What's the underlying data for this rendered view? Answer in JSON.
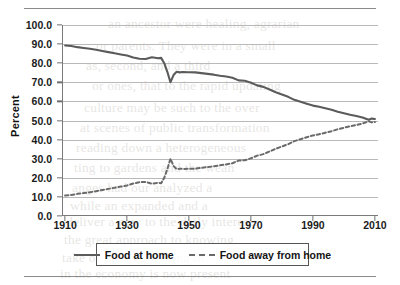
{
  "figure": {
    "rule_top": "",
    "rule_bottom": ""
  },
  "axis": {
    "y_title": "Percent"
  },
  "legend": {
    "items": [
      {
        "label": "Food at home",
        "style": "solid",
        "color": "#5b5b5b"
      },
      {
        "label": "Food away from home",
        "style": "dashed",
        "color": "#6a6a6a"
      }
    ]
  },
  "background_text": [
    {
      "text": "an ancestor were healing, agrarian",
      "x": 108,
      "y": 16
    },
    {
      "text": "or parents. They were in a small",
      "x": 96,
      "y": 38
    },
    {
      "text": "as, second, and a third",
      "x": 86,
      "y": 58
    },
    {
      "text": "or ones, that to the rapid updating",
      "x": 92,
      "y": 78
    },
    {
      "text": "culture may be such to the over",
      "x": 84,
      "y": 100
    },
    {
      "text": "at scenes of public transformation",
      "x": 80,
      "y": 120
    },
    {
      "text": "reading down a heterogeneous",
      "x": 76,
      "y": 140
    },
    {
      "text": "ting to gardens and the wean",
      "x": 74,
      "y": 160
    },
    {
      "text": "anges had our analyzed a",
      "x": 72,
      "y": 180
    },
    {
      "text": "while an expanded and a",
      "x": 70,
      "y": 198
    },
    {
      "text": "deliver a new to the daily interests",
      "x": 66,
      "y": 214
    },
    {
      "text": "the great approach to knowing",
      "x": 64,
      "y": 232
    },
    {
      "text": "take of the overwriting in",
      "x": 62,
      "y": 250
    },
    {
      "text": "in the economy is now present",
      "x": 60,
      "y": 266
    }
  ],
  "chart_data": {
    "type": "line",
    "title": "",
    "xlabel": "",
    "ylabel": "Percent",
    "xlim": [
      1909,
      2011
    ],
    "ylim": [
      0,
      100
    ],
    "grid": true,
    "legend_position": "bottom",
    "ytick_labels": [
      "0.0",
      "10.0",
      "20.0",
      "30.0",
      "40.0",
      "50.0",
      "60.0",
      "70.0",
      "80.0",
      "90.0",
      "100.0"
    ],
    "ytick_values": [
      0,
      10,
      20,
      30,
      40,
      50,
      60,
      70,
      80,
      90,
      100
    ],
    "xtick_labels": [
      "1910",
      "1930",
      "1950",
      "1970",
      "1990",
      "2010"
    ],
    "xtick_values": [
      1910,
      1930,
      1950,
      1970,
      1990,
      2010
    ],
    "series": [
      {
        "name": "Food at home",
        "style": "solid",
        "color": "#5b5b5b",
        "x": [
          1910,
          1912,
          1914,
          1916,
          1918,
          1920,
          1922,
          1924,
          1926,
          1928,
          1930,
          1932,
          1934,
          1936,
          1938,
          1940,
          1941,
          1942,
          1943,
          1944,
          1945,
          1946,
          1947,
          1948,
          1950,
          1952,
          1954,
          1956,
          1958,
          1960,
          1962,
          1964,
          1966,
          1968,
          1970,
          1972,
          1974,
          1976,
          1978,
          1980,
          1982,
          1984,
          1986,
          1988,
          1990,
          1992,
          1994,
          1996,
          1998,
          2000,
          2002,
          2004,
          2006,
          2008,
          2009,
          2010
        ],
        "y": [
          89.3,
          89.0,
          88.4,
          88.0,
          87.6,
          87.0,
          86.4,
          85.8,
          85.2,
          84.6,
          84.0,
          83.0,
          82.3,
          82.2,
          83.1,
          82.6,
          82.8,
          80.0,
          75.5,
          70.0,
          73.8,
          75.5,
          75.2,
          75.4,
          75.3,
          75.2,
          74.8,
          74.4,
          74.0,
          73.4,
          73.0,
          72.4,
          71.0,
          70.8,
          69.8,
          68.4,
          67.6,
          66.2,
          64.8,
          63.6,
          62.4,
          60.8,
          59.8,
          58.8,
          57.8,
          57.2,
          56.4,
          55.6,
          54.6,
          53.8,
          53.0,
          52.4,
          51.6,
          50.4,
          51.0,
          50.8
        ]
      },
      {
        "name": "Food away from home",
        "style": "dashed",
        "color": "#6a6a6a",
        "x": [
          1910,
          1912,
          1914,
          1916,
          1918,
          1920,
          1922,
          1924,
          1926,
          1928,
          1930,
          1932,
          1934,
          1936,
          1938,
          1940,
          1941,
          1942,
          1943,
          1944,
          1945,
          1946,
          1947,
          1948,
          1950,
          1952,
          1954,
          1956,
          1958,
          1960,
          1962,
          1964,
          1966,
          1968,
          1970,
          1972,
          1974,
          1976,
          1978,
          1980,
          1982,
          1984,
          1986,
          1988,
          1990,
          1992,
          1994,
          1996,
          1998,
          2000,
          2002,
          2004,
          2006,
          2008,
          2009,
          2010
        ],
        "y": [
          10.7,
          11.0,
          11.6,
          12.0,
          12.4,
          13.0,
          13.6,
          14.2,
          14.8,
          15.4,
          16.0,
          17.0,
          17.7,
          17.8,
          16.9,
          17.4,
          17.2,
          20.0,
          24.5,
          30.0,
          26.2,
          24.5,
          24.8,
          24.6,
          24.7,
          24.8,
          25.2,
          25.6,
          26.0,
          26.6,
          27.0,
          27.6,
          29.0,
          29.2,
          30.2,
          31.6,
          32.4,
          33.8,
          35.2,
          36.4,
          37.6,
          39.2,
          40.2,
          41.2,
          42.2,
          42.8,
          43.6,
          44.4,
          45.4,
          46.2,
          47.0,
          47.6,
          48.4,
          49.6,
          49.0,
          49.2
        ]
      }
    ]
  }
}
